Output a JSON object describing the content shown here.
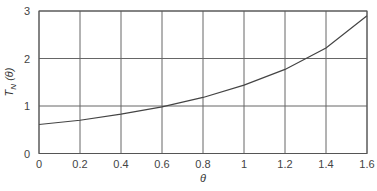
{
  "chart_data": {
    "type": "line",
    "title": "",
    "xlabel": "θ",
    "ylabel": "T_N (θ)",
    "ylabel_main": "T",
    "ylabel_sub": "N",
    "ylabel_arg": " (θ)",
    "xlim": [
      0,
      1.6
    ],
    "ylim": [
      0,
      3
    ],
    "xticks": [
      0,
      0.2,
      0.4,
      0.6,
      0.8,
      1.0,
      1.2,
      1.4,
      1.6
    ],
    "xtick_labels": [
      "0",
      "0.2",
      "0.4",
      "0.6",
      "0.8",
      "1",
      "1.2",
      "1.4",
      "1.6"
    ],
    "yticks": [
      0,
      1,
      2,
      3
    ],
    "ytick_labels": [
      "0",
      "1",
      "2",
      "3"
    ],
    "grid": true,
    "legend": null,
    "series": [
      {
        "name": "T_N(θ)",
        "color": "#444444",
        "x": [
          0,
          0.2,
          0.4,
          0.6,
          0.8,
          1.0,
          1.2,
          1.4,
          1.6
        ],
        "y": [
          0.61,
          0.7,
          0.83,
          0.98,
          1.18,
          1.44,
          1.77,
          2.22,
          2.9
        ]
      }
    ]
  }
}
